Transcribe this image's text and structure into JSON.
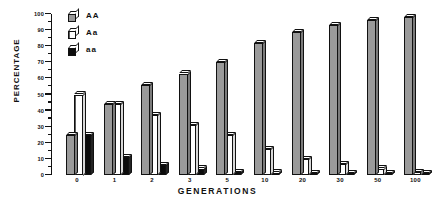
{
  "axes": {
    "ylabel": "PERCENTAGE",
    "xlabel": "GENERATIONS",
    "y_ticks": [
      "0",
      "10",
      "20",
      "30",
      "40",
      "50",
      "60",
      "70",
      "80",
      "90",
      "100"
    ]
  },
  "legend": {
    "items": [
      {
        "label": "AA",
        "icon": "cube-icon-gray",
        "swatch": "#9a9a9a"
      },
      {
        "label": "Aa",
        "icon": "cube-icon-hatched",
        "swatch": "#ffffff"
      },
      {
        "label": "aa",
        "icon": "cube-icon-black",
        "swatch": "#0c0c0c"
      }
    ]
  },
  "chart_data": {
    "type": "bar",
    "title": "",
    "xlabel": "GENERATIONS",
    "ylabel": "PERCENTAGE",
    "ylim": [
      0,
      100
    ],
    "ytick_step": 10,
    "grid": false,
    "legend_position": "top-left",
    "categories": [
      "0",
      "1",
      "2",
      "3",
      "5",
      "10",
      "20",
      "30",
      "50",
      "100"
    ],
    "series": [
      {
        "name": "AA",
        "values": [
          25,
          44,
          56,
          63,
          70,
          82,
          89,
          93,
          96,
          98
        ]
      },
      {
        "name": "Aa",
        "values": [
          50,
          44,
          37,
          31,
          25,
          16,
          10,
          7,
          4,
          2
        ]
      },
      {
        "name": "aa",
        "values": [
          25,
          11,
          6,
          4,
          2,
          1.5,
          1,
          0.8,
          0.6,
          0.5
        ]
      }
    ]
  }
}
